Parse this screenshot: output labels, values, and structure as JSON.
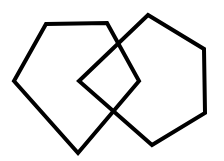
{
  "diagram": {
    "background": "#ffffff",
    "stroke_color": "#000000",
    "stroke_width": 4,
    "shapes": [
      {
        "name": "left-pentagon",
        "type": "pentagon",
        "points": "46,24 107,23 139,81 78,153 14,81"
      },
      {
        "name": "right-pentagon",
        "type": "pentagon",
        "points": "148,15 204,49 205,113 152,145 79,81"
      }
    ]
  }
}
